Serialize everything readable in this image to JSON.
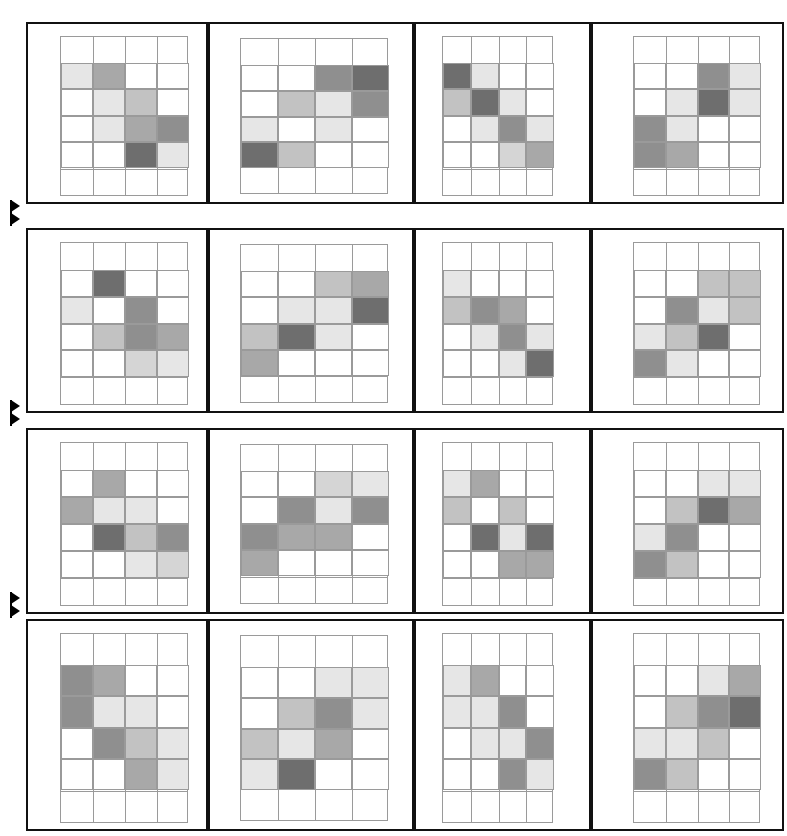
{
  "figure": {
    "title": "",
    "width": 787,
    "height": 836,
    "background": "#ffffff",
    "panel_rows": 4,
    "panel_cols": 4,
    "cell_rows": 4,
    "cell_cols": 4
  },
  "palette": {
    "level_0": "#ffffff",
    "level_1": "#f2f2f2",
    "level_2": "#e6e6e6",
    "level_3": "#d5d5d5",
    "level_4": "#c2c2c2",
    "level_5": "#a8a8a8",
    "level_6": "#8f8f8f",
    "level_7": "#6e6e6e",
    "border": "#9a9a9a",
    "panel_border": "#111111",
    "marker": "#000000"
  },
  "markers": [
    {
      "name": "row-divider-marker-1",
      "glyph": "double-arrow"
    },
    {
      "name": "row-divider-marker-2",
      "glyph": "double-arrow"
    },
    {
      "name": "row-divider-marker-3",
      "glyph": "double-arrow"
    }
  ],
  "chart_data": {
    "type": "heatmap",
    "title": "",
    "xlabel": "",
    "ylabel": "",
    "grid": true,
    "legend": "none",
    "cell_value_range": [
      0,
      7
    ],
    "note": "Each panel is an independent 4x4 heatmap; values are grayscale levels 0 (white) to 7 (dark gray)",
    "panels": [
      {
        "name": "panel-r1c1",
        "values": [
          [
            2,
            5,
            0,
            0
          ],
          [
            0,
            2,
            4,
            0
          ],
          [
            0,
            2,
            5,
            6
          ],
          [
            0,
            0,
            7,
            2
          ]
        ]
      },
      {
        "name": "panel-r1c2",
        "values": [
          [
            0,
            0,
            6,
            7
          ],
          [
            0,
            4,
            2,
            6
          ],
          [
            2,
            0,
            2,
            0
          ],
          [
            7,
            4,
            0,
            0
          ]
        ]
      },
      {
        "name": "panel-r1c3",
        "values": [
          [
            7,
            2,
            0,
            0
          ],
          [
            4,
            7,
            2,
            0
          ],
          [
            0,
            2,
            6,
            2
          ],
          [
            0,
            0,
            3,
            5
          ]
        ]
      },
      {
        "name": "panel-r1c4",
        "values": [
          [
            0,
            0,
            6,
            2
          ],
          [
            0,
            2,
            7,
            2
          ],
          [
            6,
            2,
            0,
            0
          ],
          [
            6,
            5,
            0,
            0
          ]
        ]
      },
      {
        "name": "panel-r2c1",
        "values": [
          [
            0,
            7,
            0,
            0
          ],
          [
            2,
            0,
            6,
            0
          ],
          [
            0,
            4,
            6,
            5
          ],
          [
            0,
            0,
            3,
            2
          ]
        ]
      },
      {
        "name": "panel-r2c2",
        "values": [
          [
            0,
            0,
            4,
            5
          ],
          [
            0,
            2,
            2,
            7
          ],
          [
            4,
            7,
            2,
            0
          ],
          [
            5,
            0,
            0,
            0
          ]
        ]
      },
      {
        "name": "panel-r2c3",
        "values": [
          [
            2,
            0,
            0,
            0
          ],
          [
            4,
            6,
            5,
            0
          ],
          [
            0,
            2,
            6,
            2
          ],
          [
            0,
            0,
            2,
            7
          ]
        ]
      },
      {
        "name": "panel-r2c4",
        "values": [
          [
            0,
            0,
            4,
            4
          ],
          [
            0,
            6,
            2,
            4
          ],
          [
            2,
            4,
            7,
            0
          ],
          [
            6,
            2,
            0,
            0
          ]
        ]
      },
      {
        "name": "panel-r3c1",
        "values": [
          [
            0,
            5,
            0,
            0
          ],
          [
            5,
            2,
            2,
            0
          ],
          [
            0,
            7,
            4,
            6
          ],
          [
            0,
            0,
            2,
            3
          ]
        ]
      },
      {
        "name": "panel-r3c2",
        "values": [
          [
            0,
            0,
            3,
            2
          ],
          [
            0,
            6,
            2,
            6
          ],
          [
            6,
            5,
            5,
            0
          ],
          [
            5,
            0,
            0,
            0
          ]
        ]
      },
      {
        "name": "panel-r3c3",
        "values": [
          [
            2,
            5,
            0,
            0
          ],
          [
            4,
            0,
            4,
            0
          ],
          [
            0,
            7,
            2,
            7
          ],
          [
            0,
            0,
            5,
            5
          ]
        ]
      },
      {
        "name": "panel-r3c4",
        "values": [
          [
            0,
            0,
            2,
            2
          ],
          [
            0,
            4,
            7,
            5
          ],
          [
            2,
            6,
            0,
            0
          ],
          [
            6,
            4,
            0,
            0
          ]
        ]
      },
      {
        "name": "panel-r4c1",
        "values": [
          [
            6,
            5,
            0,
            0
          ],
          [
            6,
            2,
            2,
            0
          ],
          [
            0,
            6,
            4,
            2
          ],
          [
            0,
            0,
            5,
            2
          ]
        ]
      },
      {
        "name": "panel-r4c2",
        "values": [
          [
            0,
            0,
            2,
            2
          ],
          [
            0,
            4,
            6,
            2
          ],
          [
            4,
            2,
            5,
            0
          ],
          [
            2,
            7,
            0,
            0
          ]
        ]
      },
      {
        "name": "panel-r4c3",
        "values": [
          [
            2,
            5,
            0,
            0
          ],
          [
            2,
            2,
            6,
            0
          ],
          [
            0,
            2,
            2,
            6
          ],
          [
            0,
            0,
            6,
            2
          ]
        ]
      },
      {
        "name": "panel-r4c4",
        "values": [
          [
            0,
            0,
            2,
            5
          ],
          [
            0,
            4,
            6,
            7
          ],
          [
            2,
            2,
            4,
            0
          ],
          [
            6,
            4,
            0,
            0
          ]
        ]
      }
    ]
  }
}
